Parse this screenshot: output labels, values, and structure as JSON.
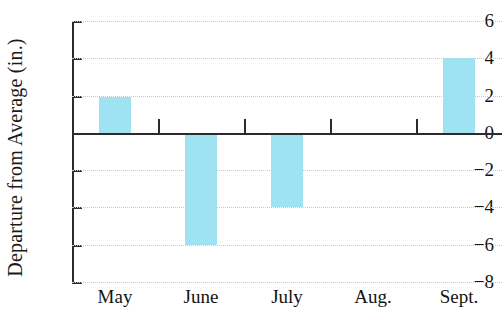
{
  "chart_data": {
    "type": "bar",
    "title": "",
    "subtitle": "",
    "xlabel": "",
    "ylabel": "Departure from Average (in.)",
    "categories": [
      "May",
      "June",
      "July",
      "Aug.",
      "Sept."
    ],
    "values": [
      1.9,
      -6,
      -4,
      0,
      4
    ],
    "series": [
      {
        "name": "Departure from Average",
        "values": [
          1.9,
          -6,
          -4,
          0,
          4
        ]
      }
    ],
    "ylim": [
      -8,
      6
    ],
    "yticks": [
      6,
      4,
      2,
      0,
      -2,
      -4,
      -6,
      -8
    ],
    "ytick_labels": [
      "6",
      "4",
      "2",
      "0",
      "−2",
      "−4",
      "−6",
      "−8"
    ],
    "grid": true,
    "grid_axis": "y",
    "legend": false,
    "legend_position": "none",
    "bar_color": "#9fe2f2",
    "axis_color": "#2b2b2b",
    "gridline_color": "#c9c9c9",
    "zero_line": 0,
    "annotations": []
  }
}
